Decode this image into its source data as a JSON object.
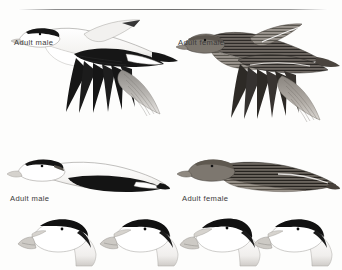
{
  "plate": {
    "kind": "field-guide-illustration-plate",
    "subject": "Common Eider",
    "background_color": "#fdfdfc",
    "rule_color": "#6f6f6f",
    "ink_dark": "#141414",
    "ink_mid": "#6b6561",
    "ink_light": "#c9c6c2",
    "label_color": "#3b3b3b"
  },
  "figures": [
    {
      "id": "flying-male-upper",
      "label": "Adult male",
      "sex": "male",
      "age": "adult",
      "pose": "flying",
      "position": "top-left"
    },
    {
      "id": "flying-female-upper",
      "label": "Adult female",
      "sex": "female",
      "age": "adult",
      "pose": "flying",
      "position": "top-right"
    },
    {
      "id": "flying-male-lower",
      "label": "Adult male",
      "sex": "male",
      "age": "adult",
      "pose": "flying",
      "position": "middle-left"
    },
    {
      "id": "flying-female-lower",
      "label": "Adult female",
      "sex": "female",
      "age": "adult",
      "pose": "flying",
      "position": "middle-right"
    }
  ],
  "head_studies": [
    {
      "id": "head-study-1",
      "sex": "male",
      "position": "bottom-1"
    },
    {
      "id": "head-study-2",
      "sex": "male",
      "position": "bottom-2"
    },
    {
      "id": "head-study-3",
      "sex": "male",
      "position": "bottom-3"
    },
    {
      "id": "head-study-4",
      "sex": "male",
      "position": "bottom-4"
    }
  ],
  "labels": {
    "male_upper": "Adult male",
    "female_upper": "Adult female",
    "male_lower": "Adult male",
    "female_lower": "Adult female"
  }
}
